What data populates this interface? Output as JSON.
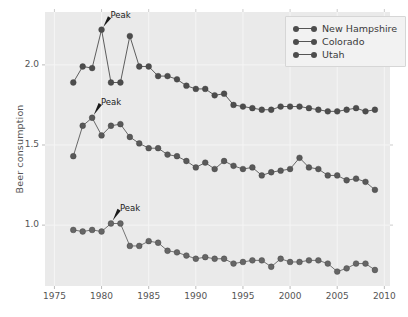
{
  "chart_data": {
    "type": "line",
    "title": "",
    "xlabel": "",
    "ylabel": "Beer consumption",
    "xlim": [
      1974.0,
      2010.6
    ],
    "ylim": [
      0.62,
      2.33
    ],
    "xticks": [
      1975,
      1980,
      1985,
      1990,
      1995,
      2000,
      2005,
      2010
    ],
    "xtick_labels": [
      "1975",
      "1980",
      "1985",
      "1990",
      "1995",
      "2000",
      "2005",
      "2010"
    ],
    "yticks": [
      1.0,
      1.5,
      2.0
    ],
    "ytick_labels": [
      "1.0",
      "1.5",
      "2.0"
    ],
    "grid": true,
    "legend_position": "upper right",
    "x": [
      1977,
      1978,
      1979,
      1980,
      1981,
      1982,
      1983,
      1984,
      1985,
      1986,
      1987,
      1988,
      1989,
      1990,
      1991,
      1992,
      1993,
      1994,
      1995,
      1996,
      1997,
      1998,
      1999,
      2000,
      2001,
      2002,
      2003,
      2004,
      2005,
      2006,
      2007,
      2008,
      2009
    ],
    "series": [
      {
        "name": "New Hampshire",
        "color": "#4d4d4d",
        "values": [
          1.89,
          1.99,
          1.98,
          2.22,
          1.89,
          1.89,
          2.18,
          1.99,
          1.99,
          1.93,
          1.93,
          1.91,
          1.87,
          1.85,
          1.85,
          1.81,
          1.82,
          1.75,
          1.74,
          1.73,
          1.72,
          1.72,
          1.74,
          1.74,
          1.74,
          1.73,
          1.72,
          1.71,
          1.71,
          1.72,
          1.73,
          1.71,
          1.72
        ]
      },
      {
        "name": "Colorado",
        "color": "#595959",
        "values": [
          1.43,
          1.62,
          1.67,
          1.56,
          1.62,
          1.63,
          1.55,
          1.51,
          1.48,
          1.48,
          1.44,
          1.43,
          1.4,
          1.36,
          1.39,
          1.35,
          1.4,
          1.37,
          1.35,
          1.36,
          1.31,
          1.33,
          1.34,
          1.35,
          1.42,
          1.36,
          1.35,
          1.31,
          1.31,
          1.28,
          1.29,
          1.27,
          1.22
        ]
      },
      {
        "name": "Utah",
        "color": "#666666",
        "values": [
          0.97,
          0.96,
          0.97,
          0.96,
          1.01,
          1.01,
          0.87,
          0.87,
          0.9,
          0.89,
          0.84,
          0.83,
          0.81,
          0.79,
          0.8,
          0.79,
          0.79,
          0.76,
          0.77,
          0.78,
          0.78,
          0.74,
          0.79,
          0.77,
          0.77,
          0.78,
          0.78,
          0.76,
          0.71,
          0.73,
          0.76,
          0.76,
          0.72
        ]
      }
    ],
    "annotations": [
      {
        "text": "Peak",
        "series": "New Hampshire",
        "x": 1980,
        "y": 2.22,
        "label_x": 1981.05,
        "label_y": 2.315
      },
      {
        "text": "Peak",
        "series": "Colorado",
        "x": 1979,
        "y": 1.67,
        "label_x": 1980.05,
        "label_y": 1.775
      },
      {
        "text": "Peak",
        "series": "Utah",
        "x": 1981,
        "y": 1.01,
        "label_x": 1982.05,
        "label_y": 1.115
      }
    ]
  },
  "style": {
    "axes_facecolor": "#eaeaea",
    "figure_facecolor": "#ffffff",
    "grid_color": "#f5f5f5",
    "tick_color": "#555555",
    "annotation_color": "#1a1a1a",
    "legend_facecolor": "#f2f2f2"
  }
}
